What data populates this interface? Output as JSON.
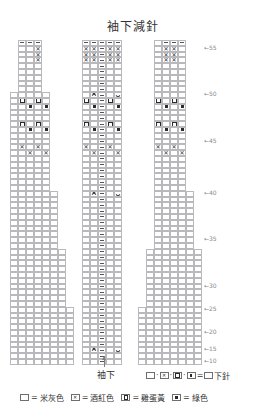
{
  "title": "袖下減針",
  "underarm": {
    "label": "袖下",
    "marker": "arrow-up"
  },
  "legend": {
    "knit_rule": {
      "symbols": [
        "□",
        "⊠",
        "▣",
        "▪"
      ],
      "equals": "=",
      "result_symbol": "囗",
      "result_label": "下針"
    },
    "colors": [
      {
        "symbol": "blank",
        "equals": "=",
        "label": "米灰色"
      },
      {
        "symbol": "cross",
        "equals": "=",
        "label": "酒紅色"
      },
      {
        "symbol": "open-dot",
        "equals": "=",
        "label": "雞蛋黃"
      },
      {
        "symbol": "filled-dot",
        "equals": "=",
        "label": "綠色"
      }
    ]
  },
  "chart_data": {
    "type": "table",
    "title": "袖下減針",
    "columns": 24,
    "rows": 56,
    "cell_width": 8,
    "cell_height": 5.8,
    "grid_left": 10,
    "grid_top": 2,
    "row_numbers": [
      55,
      50,
      45,
      40,
      35,
      30,
      25,
      20,
      15,
      10,
      5,
      3
    ],
    "row_number_arrow": "←",
    "symbol_key": {
      "dash": "horizontal bar (contrast row)",
      "cross": "⊠ wine red stitch",
      "open-dot": "▣ egg-yolk stitch",
      "filled-dot": "▪ green stitch",
      "dec-left": "left-leaning decrease",
      "dec-right": "right-leaning decrease"
    },
    "outline_steps": [
      {
        "row_from": 0,
        "row_to": 7,
        "col_start": 0,
        "col_end": 24
      },
      {
        "row_from": 8,
        "row_to": 15,
        "col_start": 0,
        "col_end": 24
      },
      {
        "row_from": 16,
        "row_to": 23,
        "col_start": 0,
        "col_end": 24
      },
      {
        "row_from": 24,
        "row_to": 31,
        "col_start": 0,
        "col_end": 24
      },
      {
        "row_from": 32,
        "row_to": 39,
        "col_start": 0,
        "col_end": 24
      },
      {
        "row_from": 40,
        "row_to": 47,
        "col_start": 0,
        "col_end": 24
      },
      {
        "row_from": 48,
        "row_to": 55,
        "col_start": 0,
        "col_end": 24
      }
    ],
    "cells": [
      {
        "r": 0,
        "c": 1,
        "s": "dash"
      },
      {
        "r": 0,
        "c": 2,
        "s": "dash"
      },
      {
        "r": 0,
        "c": 3,
        "s": "dash"
      },
      {
        "r": 0,
        "c": 9,
        "s": "dash"
      },
      {
        "r": 0,
        "c": 10,
        "s": "dash"
      },
      {
        "r": 0,
        "c": 11,
        "s": "dash"
      },
      {
        "r": 0,
        "c": 12,
        "s": "dash"
      },
      {
        "r": 0,
        "c": 13,
        "s": "dash"
      },
      {
        "r": 0,
        "c": 19,
        "s": "dash"
      },
      {
        "r": 0,
        "c": 20,
        "s": "dash"
      },
      {
        "r": 0,
        "c": 21,
        "s": "dash"
      },
      {
        "r": 1,
        "c": 3,
        "s": "cross"
      },
      {
        "r": 1,
        "c": 9,
        "s": "cross"
      },
      {
        "r": 1,
        "c": 10,
        "s": "cross"
      },
      {
        "r": 1,
        "c": 11,
        "s": "dash"
      },
      {
        "r": 1,
        "c": 12,
        "s": "cross"
      },
      {
        "r": 1,
        "c": 13,
        "s": "cross"
      },
      {
        "r": 1,
        "c": 19,
        "s": "cross"
      },
      {
        "r": 1,
        "c": 20,
        "s": "cross"
      },
      {
        "r": 2,
        "c": 3,
        "s": "cross"
      },
      {
        "r": 2,
        "c": 9,
        "s": "cross"
      },
      {
        "r": 2,
        "c": 10,
        "s": "cross"
      },
      {
        "r": 2,
        "c": 11,
        "s": "dash"
      },
      {
        "r": 2,
        "c": 12,
        "s": "cross"
      },
      {
        "r": 2,
        "c": 13,
        "s": "cross"
      },
      {
        "r": 2,
        "c": 19,
        "s": "cross"
      },
      {
        "r": 2,
        "c": 20,
        "s": "cross"
      },
      {
        "r": 3,
        "c": 3,
        "s": "cross"
      },
      {
        "r": 3,
        "c": 9,
        "s": "cross"
      },
      {
        "r": 3,
        "c": 10,
        "s": "cross"
      },
      {
        "r": 3,
        "c": 11,
        "s": "dash"
      },
      {
        "r": 3,
        "c": 12,
        "s": "cross"
      },
      {
        "r": 3,
        "c": 13,
        "s": "cross"
      },
      {
        "r": 3,
        "c": 19,
        "s": "cross"
      },
      {
        "r": 3,
        "c": 20,
        "s": "cross"
      },
      {
        "r": 4,
        "c": 11,
        "s": "dash"
      },
      {
        "r": 5,
        "c": 11,
        "s": "dash"
      },
      {
        "r": 6,
        "c": 11,
        "s": "dash"
      },
      {
        "r": 7,
        "c": 11,
        "s": "dash"
      },
      {
        "r": 8,
        "c": 11,
        "s": "dash"
      },
      {
        "r": 9,
        "c": 10,
        "s": "dec-left"
      },
      {
        "r": 9,
        "c": 11,
        "s": "dash"
      },
      {
        "r": 9,
        "c": 13,
        "s": "dec-right"
      },
      {
        "r": 10,
        "c": 1,
        "s": "open-dot"
      },
      {
        "r": 10,
        "c": 3,
        "s": "open-dot"
      },
      {
        "r": 10,
        "c": 9,
        "s": "open-dot"
      },
      {
        "r": 10,
        "c": 11,
        "s": "dash"
      },
      {
        "r": 10,
        "c": 12,
        "s": "open-dot"
      },
      {
        "r": 10,
        "c": 18,
        "s": "open-dot"
      },
      {
        "r": 10,
        "c": 20,
        "s": "open-dot"
      },
      {
        "r": 11,
        "c": 2,
        "s": "filled-dot"
      },
      {
        "r": 11,
        "c": 4,
        "s": "filled-dot"
      },
      {
        "r": 11,
        "c": 10,
        "s": "filled-dot"
      },
      {
        "r": 11,
        "c": 11,
        "s": "dash"
      },
      {
        "r": 11,
        "c": 13,
        "s": "filled-dot"
      },
      {
        "r": 11,
        "c": 19,
        "s": "filled-dot"
      },
      {
        "r": 11,
        "c": 21,
        "s": "filled-dot"
      },
      {
        "r": 12,
        "c": 11,
        "s": "dash"
      },
      {
        "r": 13,
        "c": 11,
        "s": "dash"
      },
      {
        "r": 14,
        "c": 1,
        "s": "open-dot"
      },
      {
        "r": 14,
        "c": 3,
        "s": "open-dot"
      },
      {
        "r": 14,
        "c": 9,
        "s": "open-dot"
      },
      {
        "r": 14,
        "c": 11,
        "s": "dash"
      },
      {
        "r": 14,
        "c": 12,
        "s": "open-dot"
      },
      {
        "r": 14,
        "c": 18,
        "s": "open-dot"
      },
      {
        "r": 14,
        "c": 20,
        "s": "open-dot"
      },
      {
        "r": 15,
        "c": 2,
        "s": "filled-dot"
      },
      {
        "r": 15,
        "c": 4,
        "s": "filled-dot"
      },
      {
        "r": 15,
        "c": 10,
        "s": "filled-dot"
      },
      {
        "r": 15,
        "c": 11,
        "s": "dash"
      },
      {
        "r": 15,
        "c": 13,
        "s": "filled-dot"
      },
      {
        "r": 15,
        "c": 19,
        "s": "filled-dot"
      },
      {
        "r": 15,
        "c": 21,
        "s": "filled-dot"
      },
      {
        "r": 16,
        "c": 11,
        "s": "dash"
      },
      {
        "r": 17,
        "c": 11,
        "s": "dash"
      },
      {
        "r": 18,
        "c": 1,
        "s": "cross"
      },
      {
        "r": 18,
        "c": 3,
        "s": "cross"
      },
      {
        "r": 18,
        "c": 9,
        "s": "cross"
      },
      {
        "r": 18,
        "c": 11,
        "s": "dash"
      },
      {
        "r": 18,
        "c": 12,
        "s": "cross"
      },
      {
        "r": 18,
        "c": 18,
        "s": "cross"
      },
      {
        "r": 18,
        "c": 20,
        "s": "cross"
      },
      {
        "r": 19,
        "c": 2,
        "s": "cross"
      },
      {
        "r": 19,
        "c": 4,
        "s": "cross"
      },
      {
        "r": 19,
        "c": 10,
        "s": "cross"
      },
      {
        "r": 19,
        "c": 11,
        "s": "dash"
      },
      {
        "r": 19,
        "c": 13,
        "s": "cross"
      },
      {
        "r": 19,
        "c": 19,
        "s": "cross"
      },
      {
        "r": 19,
        "c": 21,
        "s": "cross"
      },
      {
        "r": 20,
        "c": 11,
        "s": "dash"
      },
      {
        "r": 21,
        "c": 11,
        "s": "dash"
      },
      {
        "r": 22,
        "c": 11,
        "s": "dash"
      },
      {
        "r": 23,
        "c": 11,
        "s": "dash"
      },
      {
        "r": 24,
        "c": 11,
        "s": "dash"
      },
      {
        "r": 25,
        "c": 11,
        "s": "dash"
      },
      {
        "r": 26,
        "c": 10,
        "s": "dec-left"
      },
      {
        "r": 26,
        "c": 11,
        "s": "dash"
      },
      {
        "r": 26,
        "c": 13,
        "s": "dec-right"
      },
      {
        "r": 27,
        "c": 11,
        "s": "dash"
      },
      {
        "r": 28,
        "c": 11,
        "s": "dash"
      },
      {
        "r": 29,
        "c": 11,
        "s": "dash"
      },
      {
        "r": 30,
        "c": 11,
        "s": "dash"
      },
      {
        "r": 31,
        "c": 11,
        "s": "dash"
      },
      {
        "r": 32,
        "c": 11,
        "s": "dash"
      },
      {
        "r": 33,
        "c": 11,
        "s": "dash"
      },
      {
        "r": 34,
        "c": 11,
        "s": "dash"
      },
      {
        "r": 35,
        "c": 11,
        "s": "dash"
      },
      {
        "r": 36,
        "c": 11,
        "s": "dash"
      },
      {
        "r": 37,
        "c": 11,
        "s": "dash"
      },
      {
        "r": 38,
        "c": 11,
        "s": "dash"
      },
      {
        "r": 39,
        "c": 11,
        "s": "dash"
      },
      {
        "r": 40,
        "c": 11,
        "s": "dash"
      },
      {
        "r": 41,
        "c": 11,
        "s": "dash"
      },
      {
        "r": 42,
        "c": 11,
        "s": "dash"
      },
      {
        "r": 43,
        "c": 11,
        "s": "dash"
      },
      {
        "r": 44,
        "c": 11,
        "s": "dash"
      },
      {
        "r": 45,
        "c": 11,
        "s": "dash"
      },
      {
        "r": 46,
        "c": 11,
        "s": "dash"
      },
      {
        "r": 47,
        "c": 11,
        "s": "dash"
      },
      {
        "r": 48,
        "c": 11,
        "s": "dash"
      },
      {
        "r": 49,
        "c": 11,
        "s": "dash"
      },
      {
        "r": 50,
        "c": 11,
        "s": "dash"
      },
      {
        "r": 51,
        "c": 11,
        "s": "dash"
      },
      {
        "r": 52,
        "c": 11,
        "s": "dash"
      },
      {
        "r": 53,
        "c": 10,
        "s": "dec-left"
      },
      {
        "r": 53,
        "c": 11,
        "s": "dash"
      },
      {
        "r": 53,
        "c": 13,
        "s": "dec-right"
      },
      {
        "r": 54,
        "c": 11,
        "s": "dash"
      },
      {
        "r": 55,
        "c": 11,
        "s": "dash"
      }
    ],
    "row_labels": [
      {
        "row": 1,
        "text": "55"
      },
      {
        "row": 9,
        "text": "50"
      },
      {
        "row": 17,
        "text": "45"
      },
      {
        "row": 26,
        "text": "40"
      },
      {
        "row": 34,
        "text": "35"
      },
      {
        "row": 42,
        "text": "30"
      },
      {
        "row": 46,
        "text": "25"
      },
      {
        "row": 50,
        "text": "20"
      },
      {
        "row": 53,
        "text": "15"
      },
      {
        "row": 55,
        "text": "10"
      }
    ]
  }
}
